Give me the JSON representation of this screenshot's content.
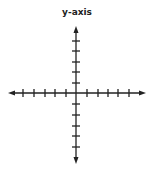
{
  "diagram": {
    "title": "y-axis",
    "color": "#222222",
    "x_axis": {
      "y": 93,
      "x_start": 8,
      "x_end": 146,
      "ticks_x": [
        23,
        34,
        45,
        55,
        66,
        87,
        98,
        108,
        118,
        129
      ],
      "arrows": [
        "left",
        "right"
      ]
    },
    "y_axis": {
      "x": 76,
      "y_start": 26,
      "y_end": 164,
      "ticks_y": [
        41,
        51,
        62,
        72,
        83,
        104,
        115,
        126,
        136,
        147
      ],
      "arrows": [
        "up",
        "down"
      ]
    }
  }
}
